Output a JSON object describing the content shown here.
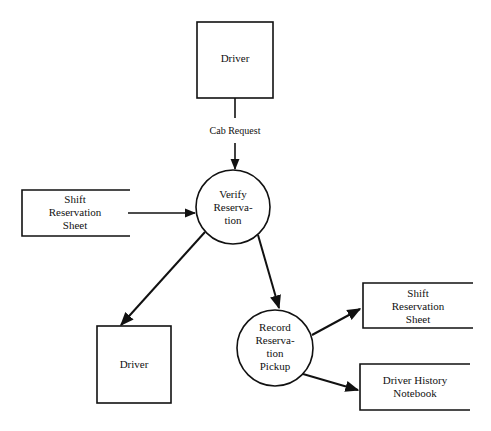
{
  "diagram": {
    "type": "data-flow-diagram",
    "external_entities": [
      {
        "id": "driver_top",
        "label": "Driver"
      },
      {
        "id": "driver_bottom",
        "label": "Driver"
      }
    ],
    "processes": [
      {
        "id": "verify",
        "lines": [
          "Verify",
          "Reserva-",
          "tion"
        ]
      },
      {
        "id": "record",
        "lines": [
          "Record",
          "Reserva-",
          "tion",
          "Pickup"
        ]
      }
    ],
    "data_stores": [
      {
        "id": "shift_left",
        "lines": [
          "Shift",
          "Reservation",
          "Sheet"
        ]
      },
      {
        "id": "shift_right",
        "lines": [
          "Shift",
          "Reservation",
          "Sheet"
        ]
      },
      {
        "id": "driver_history",
        "lines": [
          "Driver History",
          "Notebook"
        ]
      }
    ],
    "flows": [
      {
        "from": "driver_top",
        "to": "verify",
        "label": "Cab Request"
      },
      {
        "from": "shift_left",
        "to": "verify",
        "label": ""
      },
      {
        "from": "verify",
        "to": "driver_bottom",
        "label": ""
      },
      {
        "from": "verify",
        "to": "record",
        "label": ""
      },
      {
        "from": "record",
        "to": "shift_right",
        "label": ""
      },
      {
        "from": "record",
        "to": "driver_history",
        "label": ""
      }
    ]
  }
}
